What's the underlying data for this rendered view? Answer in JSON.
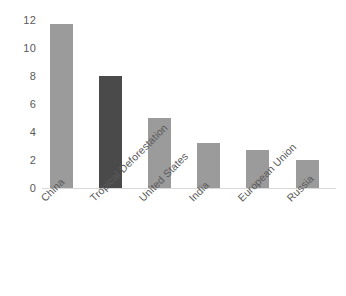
{
  "chart_data": {
    "type": "bar",
    "title": "",
    "subtitle": "",
    "xlabel": "",
    "ylabel": "",
    "categories": [
      "China",
      "Tropical Deforestation",
      "United States",
      "India",
      "European Union",
      "Russia"
    ],
    "values": [
      11.7,
      8.0,
      5.0,
      3.2,
      2.7,
      2.0
    ],
    "bar_colors": [
      "#9b9b9b",
      "#4a4a4a",
      "#9b9b9b",
      "#9b9b9b",
      "#9b9b9b",
      "#9b9b9b"
    ],
    "ylim": [
      0,
      12
    ],
    "yticks": [
      0,
      2,
      4,
      6,
      8,
      10,
      12
    ],
    "ytick_labels": [
      "0",
      "2",
      "4",
      "6",
      "8",
      "10",
      "12"
    ],
    "grid": false,
    "legend": "none",
    "highlight_category": "Tropical Deforestation",
    "axis_text_color": "#5a5a5a",
    "baseline_color": "#d8d8d8",
    "background_color": "#ffffff",
    "label_rotation_deg": -45
  }
}
